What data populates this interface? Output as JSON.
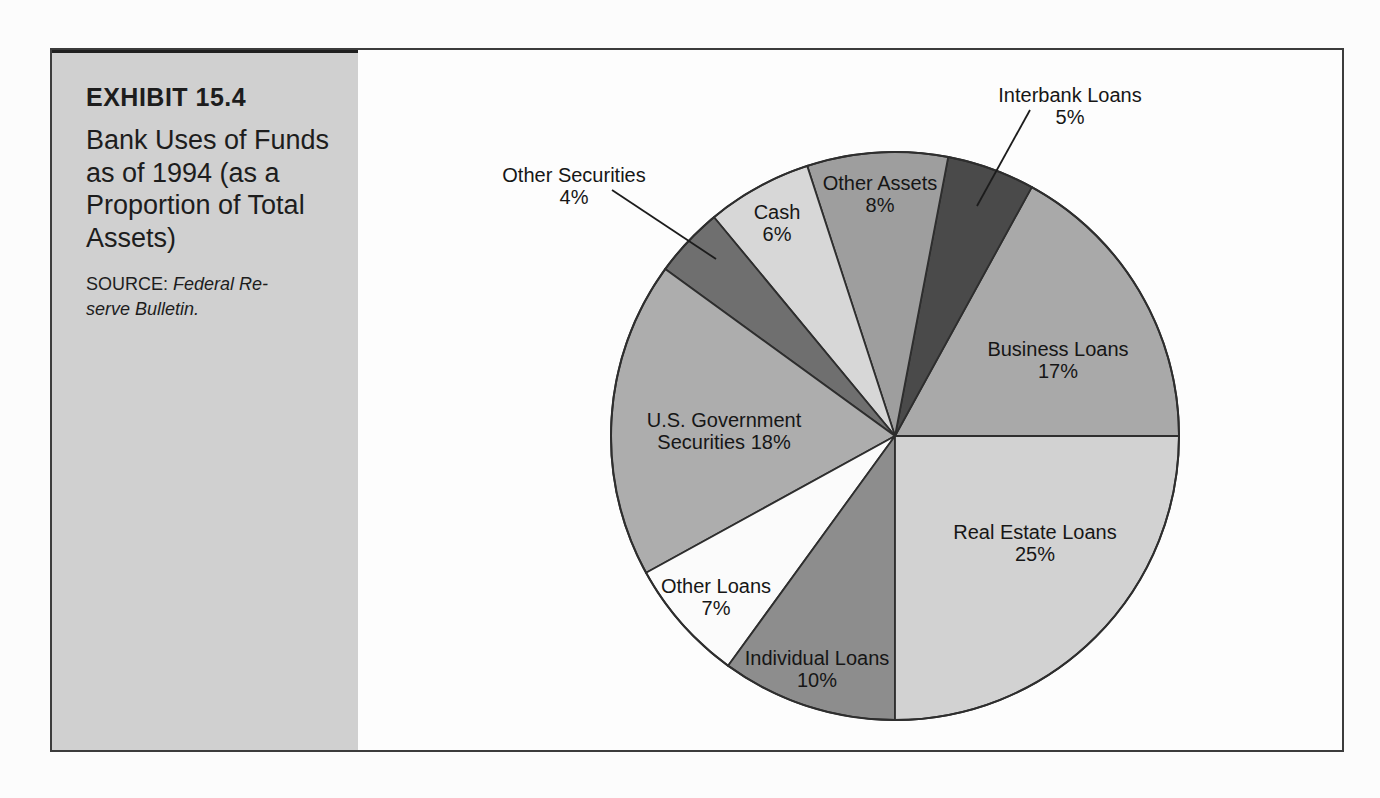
{
  "page": {
    "background": "#fcfcfc"
  },
  "sidebar": {
    "background": "#d0d0d0",
    "exhibit_label": "EXHIBIT 15.4",
    "title": "Bank Uses of Funds\nas of 1994 (as a\nProportion of Total\nAssets)",
    "source_prefix": "SOURCE: ",
    "source_citation": "Federal Re-\nserve Bulletin."
  },
  "chart_data": {
    "type": "pie",
    "title": "Bank Uses of Funds as of 1994 (as a Proportion of Total Assets)",
    "source": "Federal Reserve Bulletin",
    "unit": "percent of total assets",
    "direction": "counterclockwise",
    "start_angle_deg": 0,
    "stroke_color": "#2e2e2e",
    "geometry": {
      "cx": 895,
      "cy": 436,
      "r": 284
    },
    "slices": [
      {
        "label": "Business Loans",
        "value": 17,
        "color": "#a9a9a9",
        "label_lines": [
          "Business Loans",
          "17%"
        ],
        "label_x": 1058,
        "label_y": 360,
        "label_placement": "inside"
      },
      {
        "label": "Interbank Loans",
        "value": 5,
        "color": "#4a4a4a",
        "label_lines": [
          "Interbank Loans",
          "5%"
        ],
        "label_x": 1070,
        "label_y": 106,
        "label_placement": "outside",
        "leader": [
          1030,
          110,
          977,
          206
        ]
      },
      {
        "label": "Other Assets",
        "value": 8,
        "color": "#9e9e9e",
        "label_lines": [
          "Other Assets",
          "8%"
        ],
        "label_x": 880,
        "label_y": 194,
        "label_placement": "inside"
      },
      {
        "label": "Cash",
        "value": 6,
        "color": "#d7d7d7",
        "label_lines": [
          "Cash",
          "6%"
        ],
        "label_x": 777,
        "label_y": 223,
        "label_placement": "inside"
      },
      {
        "label": "Other Securities",
        "value": 4,
        "color": "#6f6f6f",
        "label_lines": [
          "Other Securities",
          "4%"
        ],
        "label_x": 574,
        "label_y": 186,
        "label_placement": "outside",
        "leader": [
          612,
          190,
          716,
          259
        ]
      },
      {
        "label": "U.S. Government Securities",
        "value": 18,
        "color": "#adadad",
        "label_lines": [
          "U.S. Government",
          "Securities 18%"
        ],
        "label_x": 724,
        "label_y": 431,
        "label_placement": "inside"
      },
      {
        "label": "Other Loans",
        "value": 7,
        "color": "#fbfbfb",
        "label_lines": [
          "Other Loans",
          "7%"
        ],
        "label_x": 716,
        "label_y": 597,
        "label_placement": "inside"
      },
      {
        "label": "Individual Loans",
        "value": 10,
        "color": "#8d8d8d",
        "label_lines": [
          "Individual Loans",
          "10%"
        ],
        "label_x": 817,
        "label_y": 669,
        "label_placement": "inside"
      },
      {
        "label": "Real Estate Loans",
        "value": 25,
        "color": "#d2d2d2",
        "label_lines": [
          "Real Estate Loans",
          "25%"
        ],
        "label_x": 1035,
        "label_y": 543,
        "label_placement": "inside"
      }
    ]
  }
}
